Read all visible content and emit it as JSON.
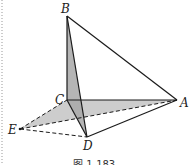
{
  "figure": {
    "caption": "图 1-183",
    "points": {
      "A": {
        "label": "A",
        "x": 177,
        "y": 100
      },
      "B": {
        "label": "B",
        "x": 67,
        "y": 16
      },
      "C": {
        "label": "C",
        "x": 67,
        "y": 100
      },
      "D": {
        "label": "D",
        "x": 87,
        "y": 137
      },
      "E": {
        "label": "E",
        "x": 20,
        "y": 129
      }
    },
    "solid_edges": [
      "BC",
      "BA",
      "BD",
      "CA",
      "DA",
      "CD"
    ],
    "dashed_edges": [
      "EC",
      "EA",
      "ED"
    ],
    "shaded_faces": [
      "BCD",
      "CEA-region"
    ],
    "colors": {
      "line": "#1a1a1a",
      "shade": "#b5b5b5",
      "border_dots": "#999999"
    }
  }
}
